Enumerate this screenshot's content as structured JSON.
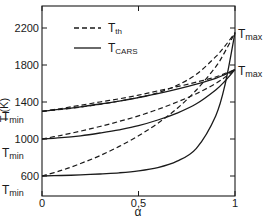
{
  "chart_data": {
    "type": "line",
    "title": "",
    "xlabel": "α",
    "ylabel": "T (K)",
    "xlim": [
      0,
      1
    ],
    "ylim": [
      380,
      2440
    ],
    "x_ticks": [
      {
        "v": 0,
        "label": "0"
      },
      {
        "v": 0.5,
        "label": "0,5"
      },
      {
        "v": 1,
        "label": "1"
      }
    ],
    "y_ticks": [
      {
        "v": 600,
        "label": "600"
      },
      {
        "v": 1000,
        "label": "1000"
      },
      {
        "v": 1400,
        "label": "1400"
      },
      {
        "v": 1800,
        "label": "1800"
      },
      {
        "v": 2200,
        "label": "2200"
      }
    ],
    "grid": false,
    "legend": {
      "position": "upper-left",
      "entries": [
        {
          "label_main": "T",
          "label_sub": "th",
          "style": "dashed"
        },
        {
          "label_main": "T",
          "label_sub": "CARS",
          "style": "solid"
        }
      ]
    },
    "annotations": [
      {
        "text_main": "T",
        "text_sub": "min",
        "near": 1300,
        "side": "left"
      },
      {
        "text_main": "T",
        "text_sub": "min",
        "near": 1000,
        "side": "left"
      },
      {
        "text_main": "T",
        "text_sub": "min",
        "near": 600,
        "side": "left"
      },
      {
        "text_main": "T",
        "text_sub": "max",
        "near": 2150,
        "side": "right"
      },
      {
        "text_main": "T",
        "text_sub": "max",
        "near": 1750,
        "side": "right"
      }
    ],
    "x": [
      0,
      0.1,
      0.2,
      0.3,
      0.4,
      0.5,
      0.6,
      0.7,
      0.8,
      0.9,
      0.95,
      1.0
    ],
    "series": [
      {
        "name": "T_th (Tmin=1300, Tmax=1750)",
        "style": "dashed",
        "values": [
          1300,
          1330,
          1365,
          1400,
          1435,
          1475,
          1520,
          1565,
          1615,
          1670,
          1710,
          1750
        ]
      },
      {
        "name": "T_CARS (Tmin=1300, Tmax=1750)",
        "style": "solid",
        "values": [
          1300,
          1322,
          1348,
          1378,
          1410,
          1448,
          1490,
          1538,
          1592,
          1655,
          1700,
          1750
        ]
      },
      {
        "name": "T_th (Tmin=1000, Tmax=1750)",
        "style": "dashed",
        "values": [
          1000,
          1040,
          1085,
          1135,
          1190,
          1250,
          1320,
          1400,
          1490,
          1600,
          1670,
          1750
        ]
      },
      {
        "name": "T_CARS (Tmin=1000, Tmax=1750)",
        "style": "solid",
        "values": [
          1000,
          1015,
          1035,
          1065,
          1100,
          1145,
          1205,
          1280,
          1380,
          1530,
          1630,
          1750
        ]
      },
      {
        "name": "T_th (Tmin=600, Tmax=2150)",
        "style": "dashed",
        "values": [
          600,
          660,
          735,
          820,
          920,
          1035,
          1170,
          1330,
          1530,
          1780,
          1950,
          2150
        ]
      },
      {
        "name": "T_CARS (Tmin=600, Tmax=2150)",
        "style": "solid",
        "values": [
          600,
          605,
          612,
          622,
          635,
          655,
          690,
          760,
          900,
          1250,
          1600,
          2150
        ]
      },
      {
        "name": "T_th (Tmin=1300, Tmax=2150)",
        "style": "dashed",
        "values": [
          1300,
          1320,
          1345,
          1375,
          1410,
          1450,
          1500,
          1580,
          1700,
          1890,
          2010,
          2150
        ]
      }
    ]
  }
}
